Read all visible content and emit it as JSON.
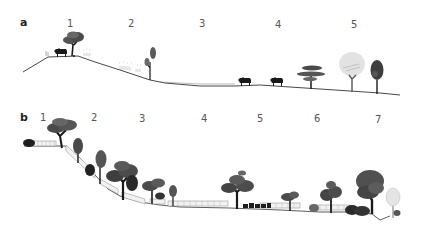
{
  "figure": {
    "panels": [
      {
        "id": "a",
        "label": "a",
        "zones": [
          "1",
          "2",
          "3",
          "4",
          "5"
        ],
        "elements": {
          "zone1": [
            "cattle",
            "canopy-tree",
            "grass-tufts"
          ],
          "zone2": [
            "grass-tufts",
            "tall-narrow-tree"
          ],
          "zone3": [
            "flat-valley-floor"
          ],
          "zone4": [
            "cattle",
            "cattle",
            "umbrella-tree"
          ],
          "zone5": [
            "pale-dead-tree",
            "dark-columnar-tree"
          ]
        }
      },
      {
        "id": "b",
        "label": "b",
        "zones": [
          "1",
          "2",
          "3",
          "4",
          "5",
          "6",
          "7"
        ],
        "elements": {
          "zone1": [
            "shrub",
            "fence",
            "canopy-tree"
          ],
          "zone2": [
            "fence",
            "columnar-tree",
            "shrub",
            "columnar-tree"
          ],
          "zone3": [
            "fence",
            "large-canopy-tree",
            "canopy-tree",
            "small-tree"
          ],
          "zone4": [
            "fence"
          ],
          "zone5": [
            "large-canopy-tree",
            "cattle-herd",
            "fence"
          ],
          "zone6": [
            "small-canopy-tree",
            "shrub",
            "canopy-tree",
            "fence"
          ],
          "zone7": [
            "shrub-cluster",
            "large-dark-tree",
            "pale-tree"
          ]
        }
      }
    ],
    "colors": {
      "ink": "#1a1a1a",
      "ground": "#333333",
      "tree_dark": "#3a3a3a",
      "tree_mid": "#5a5a5a",
      "tree_light": "#dcdcdc",
      "fence": "#9a9a9a"
    }
  }
}
